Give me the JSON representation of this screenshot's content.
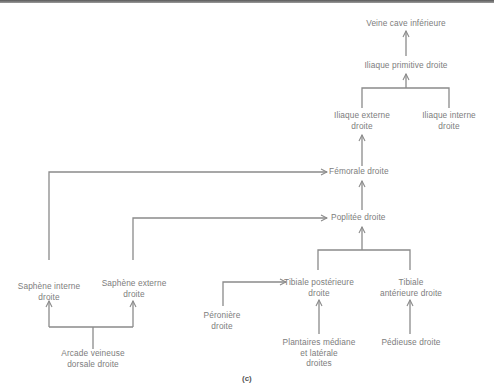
{
  "diagram": {
    "type": "venous-drainage-flow",
    "caption": "(c)",
    "line_color": "#8a8a8a",
    "nodes": {
      "veine_cave": [
        "Veine cave inférieure"
      ],
      "iliaque_primitive": [
        "Iliaque primitive droite"
      ],
      "iliaque_externe": [
        "Iliaque externe",
        "droite"
      ],
      "iliaque_interne": [
        "Iliaque interne",
        "droite"
      ],
      "femorale": [
        "Fémorale droite"
      ],
      "poplitee": [
        "Poplitée droite"
      ],
      "saphene_interne": [
        "Saphène interne",
        "droite"
      ],
      "saphene_externe": [
        "Saphène externe",
        "droite"
      ],
      "arcade": [
        "Arcade veineuse",
        "dorsale droite"
      ],
      "tibiale_posterieure": [
        "Tibiale postérieure",
        "droite"
      ],
      "tibiale_anterieure": [
        "Tibiale",
        "antérieure droite"
      ],
      "peroniere": [
        "Péronière",
        "droite"
      ],
      "plantaires": [
        "Plantaires médiane",
        "et latérale",
        "droites"
      ],
      "pedieuse": [
        "Pédieuse droite"
      ]
    },
    "edges": [
      [
        "iliaque_primitive",
        "veine_cave"
      ],
      [
        "iliaque_externe",
        "iliaque_primitive"
      ],
      [
        "iliaque_interne",
        "iliaque_primitive"
      ],
      [
        "femorale",
        "iliaque_externe"
      ],
      [
        "saphene_interne",
        "femorale"
      ],
      [
        "poplitee",
        "femorale"
      ],
      [
        "saphene_externe",
        "poplitee"
      ],
      [
        "tibiale_posterieure",
        "poplitee"
      ],
      [
        "tibiale_anterieure",
        "poplitee"
      ],
      [
        "peroniere",
        "tibiale_posterieure"
      ],
      [
        "plantaires",
        "tibiale_posterieure"
      ],
      [
        "pedieuse",
        "tibiale_anterieure"
      ],
      [
        "arcade",
        "saphene_interne"
      ],
      [
        "arcade",
        "saphene_externe"
      ]
    ]
  }
}
